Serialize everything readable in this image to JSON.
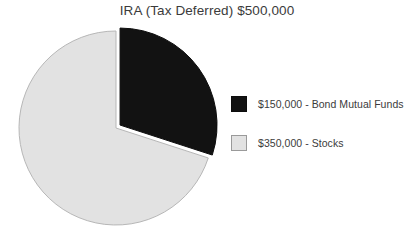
{
  "chart_data": {
    "type": "pie",
    "title": "IRA (Tax Deferred) $500,000",
    "total_label": "$500,000",
    "total_value": 500000,
    "categories": [
      "Bond Mutual Funds",
      "Stocks"
    ],
    "values": [
      150000,
      350000
    ],
    "percentages": [
      30,
      70
    ],
    "slice_angles_deg": [
      108,
      252
    ],
    "start_angle_deg": 0,
    "direction": "clockwise",
    "colors": [
      "#121212",
      "#e2e2e2"
    ],
    "slice_border_colors": [
      "#0d0d0d",
      "#b7b7b7"
    ],
    "exploded": [
      true,
      false
    ],
    "legend": [
      {
        "label": "$150,000 - Bond Mutual Funds",
        "value": 150000,
        "name": "Bond Mutual Funds",
        "color": "#121212",
        "border": "#0d0d0d"
      },
      {
        "label": "$350,000 - Stocks",
        "value": 350000,
        "name": "Stocks",
        "color": "#e2e2e2",
        "border": "#9a9a9a"
      }
    ],
    "legend_position": "right",
    "grid": false,
    "xlabel": "",
    "ylabel": "",
    "background": "#ffffff",
    "text_color": "#3b3b3b"
  }
}
